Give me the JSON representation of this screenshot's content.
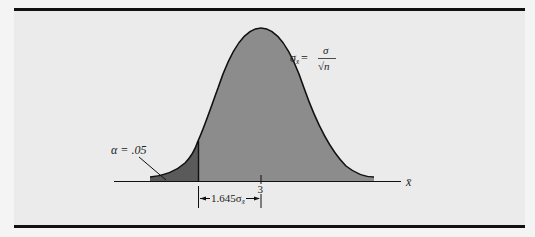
{
  "diagram": {
    "type": "normal-distribution-lower-tail",
    "formula": {
      "lhs": "σ",
      "lhs_sub": "x̄",
      "equals": "=",
      "numerator": "σ",
      "denominator": "√n"
    },
    "alpha_label": "α = .05",
    "mean_label": "3",
    "axis_label": "x̄",
    "dimension_label": "1.645σ",
    "dimension_sub": "x̄",
    "colors": {
      "background": "#ebebeb",
      "body_fill": "#8c8c8c",
      "tail_fill": "#5a5a5a",
      "curve": "#111111",
      "rules": "#111111"
    }
  }
}
